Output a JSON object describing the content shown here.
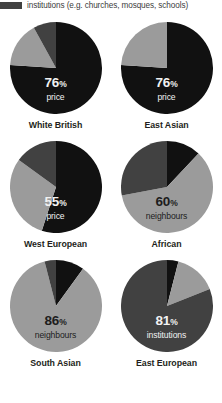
{
  "legend": {
    "items": [
      {
        "key": "institutions",
        "label": "institutions (e.g. churches, mosques, schools)",
        "color": "#414141"
      }
    ]
  },
  "palette": {
    "price": "#111111",
    "neighbours": "#9b9b9b",
    "institutions": "#414141"
  },
  "chart_data": {
    "type": "pie",
    "title": "",
    "legend_position": "top",
    "categories": [
      "price",
      "neighbours",
      "institutions"
    ],
    "charts": [
      {
        "group": "White British",
        "highlight_value": "76",
        "highlight_symbol": "%",
        "highlight_category": "neighbours_or_price",
        "highlight_label": "price",
        "label_color": "on-dark",
        "slices": [
          {
            "name": "price",
            "value": 76,
            "color": "#111111"
          },
          {
            "name": "neighbours",
            "value": 16,
            "color": "#9b9b9b"
          },
          {
            "name": "institutions",
            "value": 8,
            "color": "#414141"
          }
        ]
      },
      {
        "group": "East Asian",
        "highlight_value": "76",
        "highlight_symbol": "%",
        "highlight_label": "price",
        "label_color": "on-dark",
        "slices": [
          {
            "name": "price",
            "value": 76,
            "color": "#111111"
          },
          {
            "name": "neighbours",
            "value": 24,
            "color": "#9b9b9b"
          },
          {
            "name": "institutions",
            "value": 0,
            "color": "#414141"
          }
        ]
      },
      {
        "group": "West European",
        "highlight_value": "55",
        "highlight_symbol": "%",
        "highlight_label": "price",
        "label_color": "on-dark",
        "slices": [
          {
            "name": "price",
            "value": 55,
            "color": "#111111"
          },
          {
            "name": "neighbours",
            "value": 30,
            "color": "#9b9b9b"
          },
          {
            "name": "institutions",
            "value": 15,
            "color": "#414141"
          }
        ]
      },
      {
        "group": "African",
        "highlight_value": "60",
        "highlight_symbol": "%",
        "highlight_label": "neighbours",
        "label_color": "on-light",
        "slices": [
          {
            "name": "price",
            "value": 12,
            "color": "#111111"
          },
          {
            "name": "neighbours",
            "value": 60,
            "color": "#9b9b9b"
          },
          {
            "name": "institutions",
            "value": 28,
            "color": "#414141"
          }
        ]
      },
      {
        "group": "South Asian",
        "highlight_value": "86",
        "highlight_symbol": "%",
        "highlight_label": "neighbours",
        "label_color": "on-light",
        "slices": [
          {
            "name": "price",
            "value": 10,
            "color": "#111111"
          },
          {
            "name": "neighbours",
            "value": 86,
            "color": "#9b9b9b"
          },
          {
            "name": "institutions",
            "value": 4,
            "color": "#414141"
          }
        ]
      },
      {
        "group": "East European",
        "highlight_value": "81",
        "highlight_symbol": "%",
        "highlight_label": "institutions",
        "label_color": "on-dark",
        "slices": [
          {
            "name": "price",
            "value": 4,
            "color": "#111111"
          },
          {
            "name": "neighbours",
            "value": 15,
            "color": "#9b9b9b"
          },
          {
            "name": "institutions",
            "value": 81,
            "color": "#414141"
          }
        ]
      }
    ]
  }
}
